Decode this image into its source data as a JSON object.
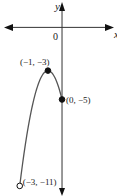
{
  "chart_data": {
    "type": "line",
    "title": "",
    "xlabel": "x",
    "ylabel": "y",
    "origin_label": "0",
    "function": "y = -2(x+1)^2 - 3",
    "domain": [
      -3,
      0
    ],
    "xlim": [
      -4.4,
      3.9
    ],
    "ylim": [
      -11.7,
      1.9
    ],
    "series": [
      {
        "name": "parabola",
        "x": [
          -3,
          -2.5,
          -2,
          -1.5,
          -1,
          -0.5,
          0
        ],
        "y": [
          -11,
          -7.5,
          -5,
          -3.5,
          -3,
          -3.5,
          -5
        ]
      }
    ],
    "points": [
      {
        "x": -1,
        "y": -3,
        "label": "(−1, −3)",
        "style": "filled"
      },
      {
        "x": 0,
        "y": -5,
        "label": "(0, −5)",
        "style": "filled"
      },
      {
        "x": -3,
        "y": -11,
        "label": "(−3, −11)",
        "style": "open"
      }
    ],
    "y_axis_continues_below": true,
    "grid": false,
    "colors": {
      "axis": "#333333",
      "curve": "#555555",
      "point": "#111111"
    }
  }
}
